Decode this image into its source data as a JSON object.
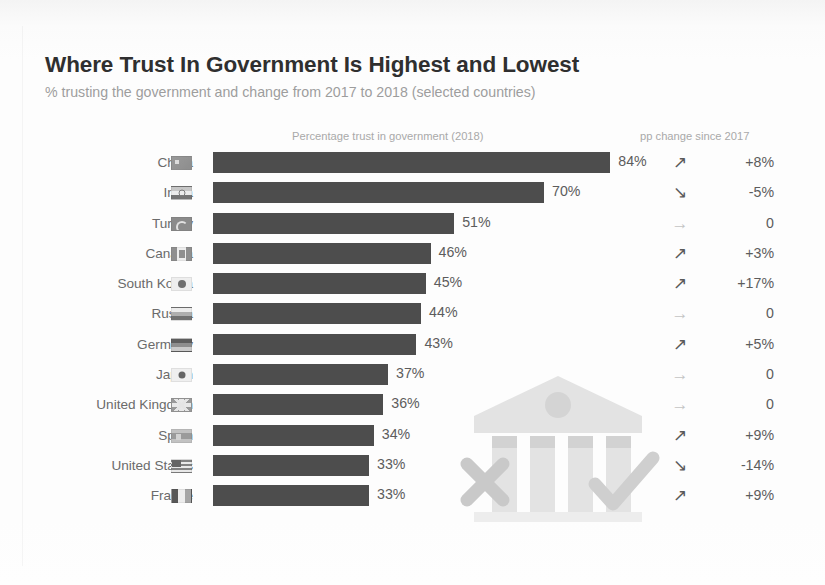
{
  "header": {
    "title": "Where Trust In Government Is Highest and Lowest",
    "subtitle": "% trusting the government and change from 2017 to 2018 (selected countries)",
    "bars_column_header": "Percentage trust in government (2018)",
    "change_column_header": "pp change since 2017"
  },
  "colors": {
    "bar": "#4d4d4d",
    "title": "#2f2f2f",
    "subtitle": "#9d9d9d",
    "label": "#6b6b6b",
    "value": "#5c5c5c",
    "arrow_up": "#5a5a5a",
    "arrow_flat": "#c4c4c4",
    "background": "#fdfdfd",
    "watermark": "#e2e2e2"
  },
  "watermark": {
    "name": "government-building-icon",
    "marks": [
      "x-mark",
      "check-mark"
    ]
  },
  "chart_data": {
    "type": "bar",
    "title": "Where Trust In Government Is Highest and Lowest",
    "subtitle": "% trusting the government and change from 2017 to 2018 (selected countries)",
    "xlabel": "Percentage trust in government (2018)",
    "ylabel": "",
    "xlim": [
      0,
      90
    ],
    "grid": false,
    "orientation": "horizontal",
    "categories": [
      "China",
      "India",
      "Turkey",
      "Canada",
      "South Korea",
      "Russia",
      "Germany",
      "Japan",
      "United Kingdom",
      "Spain",
      "United States",
      "France"
    ],
    "values": [
      84,
      70,
      51,
      46,
      45,
      44,
      43,
      37,
      36,
      34,
      33,
      33
    ],
    "value_labels": [
      "84%",
      "70%",
      "51%",
      "46%",
      "45%",
      "44%",
      "43%",
      "37%",
      "36%",
      "34%",
      "33%",
      "33%"
    ],
    "annotations": {
      "name": "pp change since 2017",
      "values": [
        8,
        -5,
        0,
        3,
        17,
        0,
        5,
        0,
        0,
        9,
        -14,
        9
      ],
      "labels": [
        "+8%",
        "-5%",
        "0",
        "+3%",
        "+17%",
        "0",
        "+5%",
        "0",
        "0",
        "+9%",
        "-14%",
        "+9%"
      ],
      "directions": [
        "up",
        "down",
        "flat",
        "up",
        "up",
        "flat",
        "up",
        "flat",
        "flat",
        "up",
        "down",
        "up"
      ]
    }
  },
  "rows": [
    {
      "country": "China",
      "value": 84,
      "value_label": "84%",
      "change_label": "+8%",
      "arrow": "↗",
      "dir": "up",
      "flag": "china-flag-icon"
    },
    {
      "country": "India",
      "value": 70,
      "value_label": "70%",
      "change_label": "-5%",
      "arrow": "↘",
      "dir": "down",
      "flag": "india-flag-icon"
    },
    {
      "country": "Turkey",
      "value": 51,
      "value_label": "51%",
      "change_label": "0",
      "arrow": "→",
      "dir": "flat",
      "flag": "turkey-flag-icon"
    },
    {
      "country": "Canada",
      "value": 46,
      "value_label": "46%",
      "change_label": "+3%",
      "arrow": "↗",
      "dir": "up",
      "flag": "canada-flag-icon"
    },
    {
      "country": "South Korea",
      "value": 45,
      "value_label": "45%",
      "change_label": "+17%",
      "arrow": "↗",
      "dir": "up",
      "flag": "south-korea-flag-icon"
    },
    {
      "country": "Russia",
      "value": 44,
      "value_label": "44%",
      "change_label": "0",
      "arrow": "→",
      "dir": "flat",
      "flag": "russia-flag-icon"
    },
    {
      "country": "Germany",
      "value": 43,
      "value_label": "43%",
      "change_label": "+5%",
      "arrow": "↗",
      "dir": "up",
      "flag": "germany-flag-icon"
    },
    {
      "country": "Japan",
      "value": 37,
      "value_label": "37%",
      "change_label": "0",
      "arrow": "→",
      "dir": "flat",
      "flag": "japan-flag-icon"
    },
    {
      "country": "United Kingdom",
      "value": 36,
      "value_label": "36%",
      "change_label": "0",
      "arrow": "→",
      "dir": "flat",
      "flag": "united-kingdom-flag-icon"
    },
    {
      "country": "Spain",
      "value": 34,
      "value_label": "34%",
      "change_label": "+9%",
      "arrow": "↗",
      "dir": "up",
      "flag": "spain-flag-icon"
    },
    {
      "country": "United States",
      "value": 33,
      "value_label": "33%",
      "change_label": "-14%",
      "arrow": "↘",
      "dir": "down",
      "flag": "united-states-flag-icon"
    },
    {
      "country": "France",
      "value": 33,
      "value_label": "33%",
      "change_label": "+9%",
      "arrow": "↗",
      "dir": "up",
      "flag": "france-flag-icon"
    }
  ]
}
